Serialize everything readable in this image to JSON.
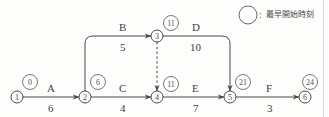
{
  "diagram": {
    "type": "pert-network",
    "legend": {
      "symbol_name": "circle-outline",
      "separator": ":",
      "text": "最早開始時刻"
    },
    "nodes": [
      {
        "id": "1",
        "label": "①",
        "est": "⓪",
        "est_value": "0",
        "x": 17,
        "y": 97
      },
      {
        "id": "2",
        "label": "②",
        "est": "⑥",
        "est_value": "6",
        "x": 85,
        "y": 97
      },
      {
        "id": "3",
        "label": "③",
        "est": "⑪",
        "est_value": "11",
        "x": 157,
        "y": 36
      },
      {
        "id": "4",
        "label": "④",
        "est": "⑪",
        "est_value": "11",
        "x": 157,
        "y": 97
      },
      {
        "id": "5",
        "label": "⑤",
        "est": "㉑",
        "est_value": "21",
        "x": 230,
        "y": 97
      },
      {
        "id": "6",
        "label": "⑥",
        "est": "㉔",
        "est_value": "24",
        "x": 305,
        "y": 97
      }
    ],
    "activities": [
      {
        "name": "A",
        "duration": "6",
        "from": "1",
        "to": "2",
        "style": "solid"
      },
      {
        "name": "B",
        "duration": "5",
        "from": "2",
        "to": "3",
        "style": "solid"
      },
      {
        "name": "C",
        "duration": "4",
        "from": "2",
        "to": "4",
        "style": "solid"
      },
      {
        "name": "D",
        "duration": "10",
        "from": "3",
        "to": "5",
        "style": "solid"
      },
      {
        "name": "E",
        "duration": "7",
        "from": "4",
        "to": "5",
        "style": "solid"
      },
      {
        "name": "F",
        "duration": "3",
        "from": "5",
        "to": "6",
        "style": "solid"
      },
      {
        "name": "",
        "duration": "",
        "from": "3",
        "to": "4",
        "style": "dashed"
      }
    ],
    "labels": {
      "a_name": "A",
      "a_dur": "6",
      "b_name": "B",
      "b_dur": "5",
      "c_name": "C",
      "c_dur": "4",
      "d_name": "D",
      "d_dur": "10",
      "e_name": "E",
      "e_dur": "7",
      "f_name": "F",
      "f_dur": "3"
    },
    "node_labels": {
      "n1": "①",
      "n2": "②",
      "n3": "③",
      "n4": "④",
      "n5": "⑤",
      "n6": "⑥"
    },
    "est_labels": {
      "e1": "⓪",
      "e2": "⑥",
      "e3": "⑪",
      "e4": "⑪",
      "e5": "㉑",
      "e6": "㉔"
    },
    "colors": {
      "line": "#4a4a4a",
      "text": "#3d3d3d",
      "background": "#fdfdfc"
    }
  }
}
